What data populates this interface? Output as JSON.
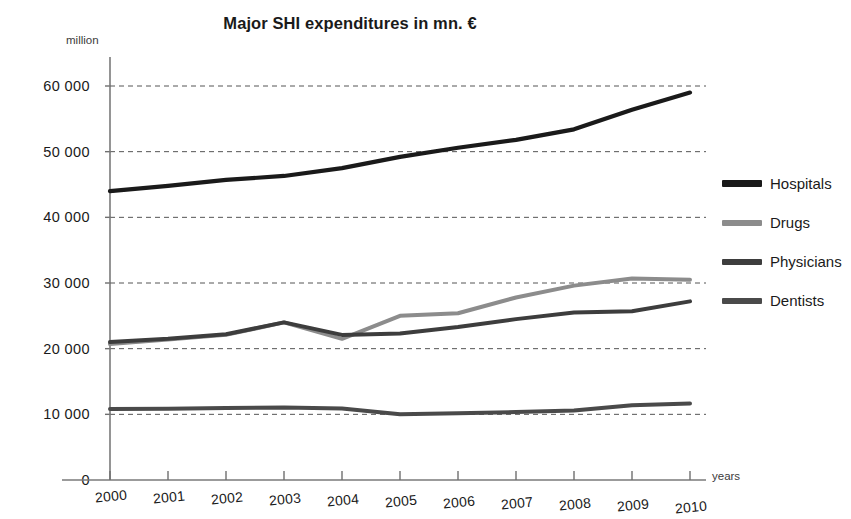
{
  "chart_data": {
    "type": "line",
    "title": "Major SHI expenditures in mn. €",
    "xlabel": "years",
    "ylabel": "million",
    "categories": [
      "2000",
      "2001",
      "2002",
      "2003",
      "2004",
      "2005",
      "2006",
      "2007",
      "2008",
      "2009",
      "2010"
    ],
    "x": [
      2000,
      2001,
      2002,
      2003,
      2004,
      2005,
      2006,
      2007,
      2008,
      2009,
      2010
    ],
    "ylim": [
      0,
      65000
    ],
    "xlim": [
      2000,
      2010
    ],
    "yticks": [
      0,
      10000,
      20000,
      30000,
      40000,
      50000,
      60000
    ],
    "ytick_labels": [
      "0",
      "10 000",
      "20 000",
      "30 000",
      "40 000",
      "50 000",
      "60 000"
    ],
    "grid": "horizontal-dashed",
    "legend_position": "right",
    "series": [
      {
        "name": "Hospitals",
        "color": "#1a1a1a",
        "width": 4.2,
        "values": [
          44000,
          44800,
          45700,
          46300,
          47500,
          49200,
          50600,
          51800,
          53400,
          56400,
          59000
        ]
      },
      {
        "name": "Drugs",
        "color": "#8c8c8c",
        "width": 4.0,
        "values": [
          20700,
          21400,
          22100,
          24000,
          21500,
          25000,
          25400,
          27800,
          29600,
          30700,
          30500
        ]
      },
      {
        "name": "Physicians",
        "color": "#3d3d3d",
        "width": 4.0,
        "values": [
          21000,
          21500,
          22200,
          24000,
          22100,
          22300,
          23300,
          24500,
          25500,
          25700,
          27200
        ]
      },
      {
        "name": "Dentists",
        "color": "#4a4a4a",
        "width": 4.0,
        "values": [
          10800,
          10850,
          10950,
          11050,
          10900,
          10000,
          10150,
          10350,
          10600,
          11400,
          11650
        ]
      }
    ]
  },
  "legend": {
    "items": [
      {
        "label": "Hospitals"
      },
      {
        "label": "Drugs"
      },
      {
        "label": "Physicians"
      },
      {
        "label": "Dentists"
      }
    ]
  }
}
